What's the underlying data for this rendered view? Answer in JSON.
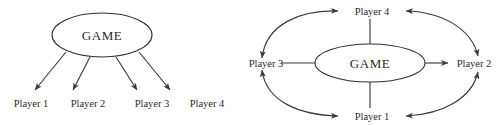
{
  "figure": {
    "background_color": "#ffffff",
    "stroke_color": "#3a3a38",
    "text_color": "#2b2b29",
    "left_diagram": {
      "center": {
        "label": "GAME",
        "shape": "ellipse"
      },
      "players": [
        {
          "label": "Player 1"
        },
        {
          "label": "Player 2"
        },
        {
          "label": "Player 3"
        },
        {
          "label": "Player 4"
        }
      ],
      "edges": [
        {
          "from": "GAME",
          "to": "Player 1",
          "style": "straight",
          "arrow": "single"
        },
        {
          "from": "GAME",
          "to": "Player 2",
          "style": "straight",
          "arrow": "single"
        },
        {
          "from": "GAME",
          "to": "Player 3",
          "style": "straight",
          "arrow": "single"
        },
        {
          "from": "GAME",
          "to": "Player 4",
          "style": "straight",
          "arrow": "single"
        }
      ]
    },
    "right_diagram": {
      "center": {
        "label": "GAME",
        "shape": "ellipse"
      },
      "players": [
        {
          "label": "Player 4",
          "position": "top"
        },
        {
          "label": "Player 2",
          "position": "right"
        },
        {
          "label": "Player 1",
          "position": "bottom"
        },
        {
          "label": "Player 3",
          "position": "left"
        }
      ],
      "edges": [
        {
          "from": "GAME",
          "to": "Player 4",
          "style": "straight",
          "arrow": "none"
        },
        {
          "from": "GAME",
          "to": "Player 1",
          "style": "straight",
          "arrow": "none"
        },
        {
          "from": "GAME",
          "to": "Player 3",
          "style": "straight",
          "arrow": "none"
        },
        {
          "from": "GAME",
          "to": "Player 2",
          "style": "straight",
          "arrow": "single"
        },
        {
          "from": "Player 3",
          "to": "Player 4",
          "style": "curved",
          "arrow": "double"
        },
        {
          "from": "Player 4",
          "to": "Player 2",
          "style": "curved",
          "arrow": "double"
        },
        {
          "from": "Player 3",
          "to": "Player 1",
          "style": "curved",
          "arrow": "double"
        },
        {
          "from": "Player 1",
          "to": "Player 2",
          "style": "curved",
          "arrow": "double"
        }
      ]
    }
  }
}
